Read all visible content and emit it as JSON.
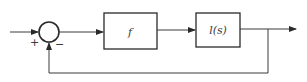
{
  "diagram": {
    "type": "feedback-block-diagram",
    "summing_junction": {
      "plus_sign": "+",
      "minus_sign": "−"
    },
    "blocks": [
      {
        "id": "forward-block-1",
        "label": "f"
      },
      {
        "id": "forward-block-2",
        "label": "l(s)"
      }
    ],
    "colors": {
      "stroke": "#2a2a2a",
      "background": "#ffffff"
    }
  }
}
